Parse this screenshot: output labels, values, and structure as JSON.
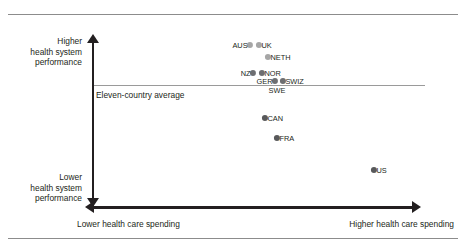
{
  "figure": {
    "average_line_label": "Eleven-country average",
    "y_axis": {
      "top_label": "Higher\nhealth system\nperformance",
      "top_label_lines": [
        "Higher",
        "health system",
        "performance"
      ],
      "bottom_label_lines": [
        "Lower",
        "health system",
        "performance"
      ]
    },
    "x_axis": {
      "left_label": "Lower health care spending",
      "right_label": "Higher health care spending"
    }
  },
  "chart_data": {
    "type": "scatter",
    "title": "",
    "xlabel": "Health care spending",
    "ylabel": "Health system performance",
    "grid": false,
    "legend": false,
    "annotations": [
      {
        "name": "eleven-country-average",
        "text": "Eleven-country average",
        "y_px": 85.4
      }
    ],
    "axis_captions": {
      "y_top": [
        "Higher",
        "health system",
        "performance"
      ],
      "y_bottom": [
        "Lower",
        "health system",
        "performance"
      ],
      "x_left": "Lower health care spending",
      "x_right": "Higher health care spending"
    },
    "colors": {
      "above_average_dot": "#a6a6a6",
      "below_average_dot": "#58595b",
      "average_line": "#9a9a9a",
      "axis": "#231f20"
    },
    "points": [
      {
        "label": "AUS",
        "x_px": 250.0,
        "y_px": 44.5,
        "label_pos": "left",
        "color": "#a6a6a6",
        "visible_dot": true
      },
      {
        "label": "UK",
        "x_px": 259.0,
        "y_px": 44.5,
        "label_pos": "right",
        "color": "#a6a6a6",
        "visible_dot": true
      },
      {
        "label": "NETH",
        "x_px": 268.0,
        "y_px": 57.0,
        "label_pos": "right",
        "color": "#a6a6a6",
        "visible_dot": true
      },
      {
        "label": "NZ",
        "x_px": 253.0,
        "y_px": 72.5,
        "label_pos": "left",
        "color": "#6d6e71",
        "visible_dot": true
      },
      {
        "label": "NOR",
        "x_px": 262.0,
        "y_px": 72.5,
        "label_pos": "right",
        "color": "#6d6e71",
        "visible_dot": true
      },
      {
        "label": "GER",
        "x_px": 275.0,
        "y_px": 80.5,
        "label_pos": "left",
        "color": "#6d6e71",
        "visible_dot": true
      },
      {
        "label": "SWIZ",
        "x_px": 283.0,
        "y_px": 80.5,
        "label_pos": "right",
        "color": "#6d6e71",
        "visible_dot": true
      },
      {
        "label": "SWE",
        "x_px": 277.0,
        "y_px": 85.4,
        "label_pos": "below",
        "color": "#58595b",
        "visible_dot": false
      },
      {
        "label": "CAN",
        "x_px": 265.0,
        "y_px": 118.0,
        "label_pos": "right",
        "color": "#58595b",
        "visible_dot": true
      },
      {
        "label": "FRA",
        "x_px": 277.0,
        "y_px": 138.0,
        "label_pos": "right",
        "color": "#58595b",
        "visible_dot": true
      },
      {
        "label": "US",
        "x_px": 374.0,
        "y_px": 170.0,
        "label_pos": "right",
        "color": "#58595b",
        "visible_dot": true
      }
    ]
  }
}
